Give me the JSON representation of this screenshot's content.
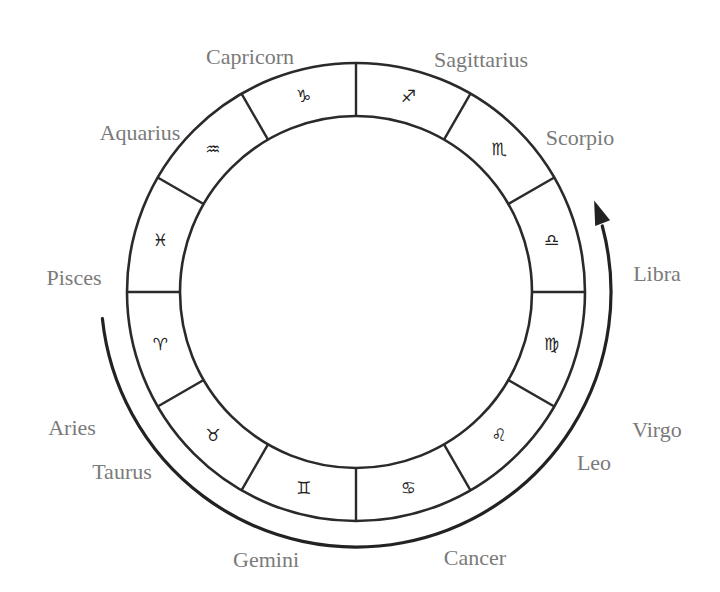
{
  "diagram": {
    "center": {
      "x": 356,
      "y": 292
    },
    "outer_radius": 229,
    "inner_radius": 176,
    "arrow_radius": 255,
    "colors": {
      "line": "#2a2a2a",
      "label": "#7a7a7a",
      "glyph": "#222222",
      "background": "#ffffff"
    },
    "arrow": {
      "direction": "counter-clockwise (Aries → Taurus → Gemini → Cancer → Leo → Virgo → Libra)",
      "start_angle_deg": 174,
      "end_angle_deg": -21
    },
    "signs": [
      {
        "name": "Capricorn",
        "symbol": "♑",
        "sector_mid_deg": -105,
        "label_x": 250,
        "label_y": 57
      },
      {
        "name": "Sagittarius",
        "symbol": "♐",
        "sector_mid_deg": -75,
        "label_x": 481,
        "label_y": 60
      },
      {
        "name": "Scorpio",
        "symbol": "♏",
        "sector_mid_deg": -45,
        "label_x": 580,
        "label_y": 138
      },
      {
        "name": "Libra",
        "symbol": "♎",
        "sector_mid_deg": -15,
        "label_x": 657,
        "label_y": 274
      },
      {
        "name": "Virgo",
        "symbol": "♍",
        "sector_mid_deg": 15,
        "label_x": 657,
        "label_y": 430
      },
      {
        "name": "Leo",
        "symbol": "♌",
        "sector_mid_deg": 45,
        "label_x": 594,
        "label_y": 463
      },
      {
        "name": "Cancer",
        "symbol": "♋",
        "sector_mid_deg": 75,
        "label_x": 475,
        "label_y": 558
      },
      {
        "name": "Gemini",
        "symbol": "♊",
        "sector_mid_deg": 105,
        "label_x": 266,
        "label_y": 560
      },
      {
        "name": "Taurus",
        "symbol": "♉",
        "sector_mid_deg": 135,
        "label_x": 122,
        "label_y": 472
      },
      {
        "name": "Aries",
        "symbol": "♈",
        "sector_mid_deg": 165,
        "label_x": 72,
        "label_y": 428
      },
      {
        "name": "Pisces",
        "symbol": "♓",
        "sector_mid_deg": 195,
        "label_x": 74,
        "label_y": 278
      },
      {
        "name": "Aquarius",
        "symbol": "♒",
        "sector_mid_deg": 225,
        "label_x": 140,
        "label_y": 133
      }
    ]
  }
}
